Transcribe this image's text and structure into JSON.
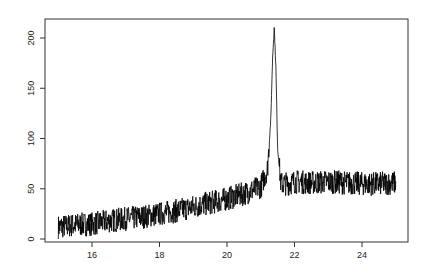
{
  "chart_data": {
    "type": "line",
    "title": "",
    "xlabel": "",
    "ylabel": "",
    "xlim": [
      14.7,
      25.3
    ],
    "ylim": [
      -5,
      220
    ],
    "grid": false,
    "legend": null,
    "x_ticks": [
      "16",
      "18",
      "20",
      "22",
      "24"
    ],
    "y_ticks": [
      "0",
      "50",
      "100",
      "150",
      "200"
    ],
    "series": [
      {
        "name": "signal",
        "x": [
          15.0,
          15.5,
          16.0,
          16.5,
          17.0,
          17.5,
          18.0,
          18.5,
          19.0,
          19.5,
          20.0,
          20.5,
          21.0,
          21.2,
          21.3,
          21.35,
          21.4,
          21.45,
          21.5,
          21.6,
          21.8,
          22.0,
          22.5,
          23.0,
          23.5,
          24.0,
          24.5,
          25.0
        ],
        "values": [
          12,
          14,
          15,
          18,
          20,
          22,
          25,
          28,
          32,
          36,
          40,
          45,
          52,
          70,
          120,
          180,
          210,
          170,
          90,
          55,
          55,
          57,
          56,
          57,
          56,
          55,
          55,
          56
        ],
        "noise_amplitude": 12
      }
    ]
  }
}
